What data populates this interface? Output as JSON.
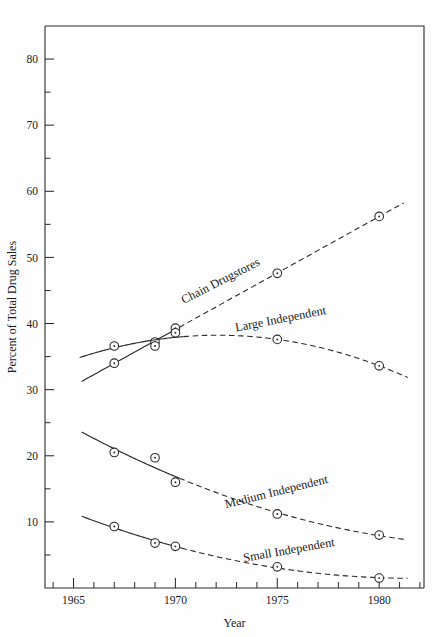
{
  "chart_data": {
    "type": "line",
    "title": "",
    "xlabel": "Year",
    "ylabel": "Percent of Total Drug Sales",
    "xlim": [
      1963.6,
      1982.2
    ],
    "ylim": [
      0,
      85
    ],
    "grid": false,
    "legend_position": "inline-labels-on-curves",
    "x_major_ticks": [
      1965,
      1970,
      1975,
      1980
    ],
    "x_major_tick_labels": [
      "1965",
      "1970",
      "1975",
      "1980"
    ],
    "x_minor_ticks": [
      1964,
      1966,
      1967,
      1968,
      1969,
      1971,
      1972,
      1973,
      1974,
      1976,
      1977,
      1978,
      1979,
      1981,
      1982
    ],
    "y_major_ticks": [
      10,
      20,
      30,
      40,
      50,
      60,
      70,
      80
    ],
    "y_major_tick_labels": [
      "10",
      "20",
      "30",
      "40",
      "50",
      "60",
      "70",
      "80"
    ],
    "y_minor_ticks": [
      5,
      15,
      25,
      35,
      45,
      55,
      65,
      75
    ],
    "marker_style": "open-circle-with-center-dot",
    "series": [
      {
        "name": "Chain Drugstores",
        "label": "Chain Drugstores",
        "label_rotation": -27,
        "x": [
          1967,
          1969,
          1970,
          1975,
          1980
        ],
        "values": [
          34.0,
          37.2,
          39.3,
          47.6,
          56.2
        ],
        "fit_solid_x": [
          1965.4,
          1970.2
        ],
        "fit_dashed_x": [
          1970.2,
          1981.2
        ]
      },
      {
        "name": "Large Independent",
        "label": "Large Independent",
        "label_rotation": -11,
        "x": [
          1967,
          1969,
          1970,
          1975,
          1980
        ],
        "values": [
          36.6,
          36.6,
          38.6,
          37.6,
          33.6
        ],
        "fit_solid_x": [
          1965.3,
          1970.4
        ],
        "fit_dashed_x": [
          1970.4,
          1981.4
        ]
      },
      {
        "name": "Medium Independent",
        "label": "Medium Independent",
        "label_rotation": -14,
        "x": [
          1967,
          1969,
          1970,
          1975,
          1980
        ],
        "values": [
          20.5,
          19.7,
          16.0,
          11.2,
          8.0
        ],
        "fit_solid_x": [
          1965.4,
          1970.2
        ],
        "fit_dashed_x": [
          1970.2,
          1981.3
        ]
      },
      {
        "name": "Small Independent",
        "label": "Small Independent",
        "label_rotation": -10,
        "x": [
          1967,
          1969,
          1970,
          1975,
          1980
        ],
        "values": [
          9.3,
          6.8,
          6.3,
          3.2,
          1.5
        ],
        "fit_solid_x": [
          1965.4,
          1970.3
        ],
        "fit_dashed_x": [
          1970.3,
          1981.4
        ]
      }
    ]
  }
}
